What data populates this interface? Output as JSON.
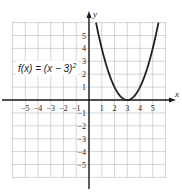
{
  "chart_data": {
    "type": "line",
    "title": "",
    "function_label": "f(x) = (x − 3)",
    "function_exponent": "2",
    "expression": "(x - 3)^2",
    "xlabel": "x",
    "ylabel": "y",
    "xlim": [
      -6,
      6
    ],
    "ylim": [
      -6,
      6
    ],
    "grid": true,
    "x_ticks": [
      -5,
      -4,
      -3,
      -2,
      -1,
      1,
      2,
      3,
      4,
      5
    ],
    "y_ticks": [
      5,
      4,
      3,
      2,
      1,
      -1,
      -2,
      -3,
      -4,
      -5
    ],
    "x_tick_labels": [
      "−5",
      "−4",
      "−3",
      "−2",
      "−1",
      "1",
      "2",
      "3",
      "4",
      "5"
    ],
    "y_tick_labels": [
      "5",
      "4",
      "3",
      "2",
      "1",
      "−1",
      "−2",
      "−3",
      "−4",
      "−5"
    ],
    "series": [
      {
        "name": "f(x) = (x - 3)^2",
        "x": [
          0.55,
          1,
          1.5,
          2,
          2.5,
          3,
          3.5,
          4,
          4.5,
          5,
          5.45
        ],
        "y": [
          6,
          4,
          2.25,
          1,
          0.25,
          0,
          0.25,
          1,
          2.25,
          4,
          6
        ]
      }
    ],
    "vertex": [
      3,
      0
    ]
  },
  "colors": {
    "axis": "#1a1a1a",
    "grid": "#9a9a9a",
    "curve": "#222222",
    "text": "#222222"
  }
}
